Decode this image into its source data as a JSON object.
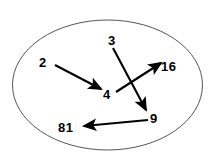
{
  "diagram": {
    "type": "function-mapping-diagram",
    "title": "",
    "boundary": {
      "shape": "ellipse",
      "cx": 107.5,
      "cy": 85,
      "rx": 95,
      "ry": 65,
      "stroke_color": "#555555",
      "stroke_width": 1,
      "fill": "none"
    },
    "stroke_color": "#000000",
    "nodes": [
      {
        "id": "n2",
        "label": "2",
        "x": 44,
        "y": 62
      },
      {
        "id": "n3",
        "label": "3",
        "x": 113,
        "y": 40
      },
      {
        "id": "n4",
        "label": "4",
        "x": 108,
        "y": 94
      },
      {
        "id": "n16",
        "label": "16",
        "x": 169,
        "y": 66
      },
      {
        "id": "n9",
        "label": "9",
        "x": 154,
        "y": 118
      },
      {
        "id": "n81",
        "label": "81",
        "x": 69,
        "y": 127
      }
    ],
    "arrows": [
      {
        "id": "a1",
        "from": "2",
        "to": "4",
        "x1": 55,
        "y1": 65,
        "x2": 101,
        "y2": 89,
        "direction": "down-right"
      },
      {
        "id": "a2",
        "from": "4",
        "to": "16",
        "x1": 116,
        "y1": 92,
        "x2": 161,
        "y2": 63,
        "direction": "up-right"
      },
      {
        "id": "a3",
        "from": "3",
        "to": "9",
        "x1": 113,
        "y1": 48,
        "x2": 146,
        "y2": 110,
        "direction": "down-right"
      },
      {
        "id": "a4",
        "from": "9",
        "to": "81",
        "x1": 148,
        "y1": 120,
        "x2": 84,
        "y2": 126,
        "direction": "left"
      }
    ]
  }
}
